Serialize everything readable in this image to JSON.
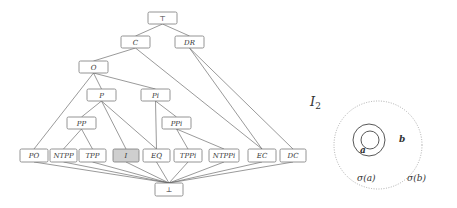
{
  "lattice": {
    "nodes": [
      {
        "id": "top",
        "label": "⊤",
        "x": 148,
        "y": 12,
        "w": 29,
        "h": 12
      },
      {
        "id": "C",
        "label": "C",
        "x": 121,
        "y": 36,
        "w": 29,
        "h": 12
      },
      {
        "id": "DR",
        "label": "DR",
        "x": 175,
        "y": 36,
        "w": 29,
        "h": 12
      },
      {
        "id": "O",
        "label": "O",
        "x": 79,
        "y": 61,
        "w": 29,
        "h": 12
      },
      {
        "id": "P",
        "label": "P",
        "x": 87,
        "y": 89,
        "w": 29,
        "h": 12
      },
      {
        "id": "Pi",
        "label": "Pi",
        "x": 141,
        "y": 89,
        "w": 29,
        "h": 12
      },
      {
        "id": "PP",
        "label": "PP",
        "x": 67,
        "y": 117,
        "w": 29,
        "h": 12
      },
      {
        "id": "PPi",
        "label": "PPi",
        "x": 162,
        "y": 117,
        "w": 29,
        "h": 12
      },
      {
        "id": "PO",
        "label": "PO",
        "x": 20,
        "y": 149,
        "w": 28,
        "h": 13
      },
      {
        "id": "NTPP",
        "label": "NTPP",
        "x": 50,
        "y": 149,
        "w": 27,
        "h": 13
      },
      {
        "id": "TPP",
        "label": "TPP",
        "x": 79,
        "y": 149,
        "w": 27,
        "h": 13
      },
      {
        "id": "I",
        "label": "I",
        "x": 113,
        "y": 149,
        "w": 26,
        "h": 13,
        "highlight": true
      },
      {
        "id": "EQ",
        "label": "EQ",
        "x": 143,
        "y": 149,
        "w": 27,
        "h": 13
      },
      {
        "id": "TPPi",
        "label": "TPPi",
        "x": 174,
        "y": 149,
        "w": 28,
        "h": 13
      },
      {
        "id": "NTPPi",
        "label": "NTPPi",
        "x": 209,
        "y": 149,
        "w": 30,
        "h": 13
      },
      {
        "id": "EC",
        "label": "EC",
        "x": 248,
        "y": 149,
        "w": 28,
        "h": 13
      },
      {
        "id": "DC",
        "label": "DC",
        "x": 280,
        "y": 149,
        "w": 26,
        "h": 13
      },
      {
        "id": "bottom",
        "label": "⊥",
        "x": 155,
        "y": 183,
        "w": 28,
        "h": 13
      }
    ],
    "edges": [
      [
        "top",
        "C"
      ],
      [
        "top",
        "DR"
      ],
      [
        "C",
        "O"
      ],
      [
        "C",
        "EC"
      ],
      [
        "DR",
        "EC"
      ],
      [
        "DR",
        "DC"
      ],
      [
        "O",
        "P"
      ],
      [
        "O",
        "Pi"
      ],
      [
        "O",
        "PO"
      ],
      [
        "P",
        "PP"
      ],
      [
        "P",
        "I"
      ],
      [
        "P",
        "EQ"
      ],
      [
        "Pi",
        "PPi"
      ],
      [
        "Pi",
        "EQ"
      ],
      [
        "PP",
        "NTPP"
      ],
      [
        "PP",
        "TPP"
      ],
      [
        "PPi",
        "TPPi"
      ],
      [
        "PPi",
        "NTPPi"
      ],
      [
        "PO",
        "bottom"
      ],
      [
        "NTPP",
        "bottom"
      ],
      [
        "TPP",
        "bottom"
      ],
      [
        "I",
        "bottom"
      ],
      [
        "EQ",
        "bottom"
      ],
      [
        "TPPi",
        "bottom"
      ],
      [
        "NTPPi",
        "bottom"
      ],
      [
        "EC",
        "bottom"
      ],
      [
        "DC",
        "bottom"
      ]
    ]
  },
  "interpretation": {
    "title": "I",
    "title_sub": "2",
    "label_a": "a",
    "label_b": "b",
    "sigma_a": "σ(a)",
    "sigma_b": "σ(b)"
  }
}
